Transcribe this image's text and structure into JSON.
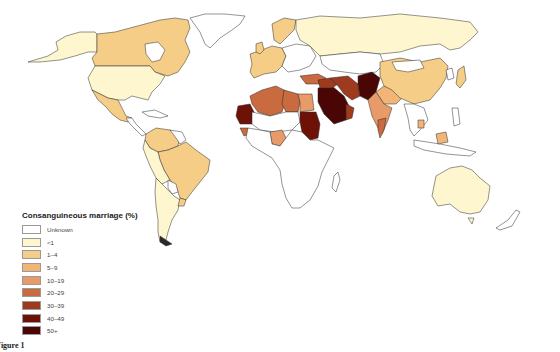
{
  "figure": {
    "caption": "Figure 1",
    "title": "Consanguineous marriage (%)"
  },
  "legend": {
    "title": "Consanguineous marriage (%)",
    "items": [
      {
        "label": "Unknown",
        "color": "#ffffff"
      },
      {
        "label": "<1",
        "color": "#fdf6cf"
      },
      {
        "label": "1–4",
        "color": "#f5cd86"
      },
      {
        "label": "5–9",
        "color": "#f2b577"
      },
      {
        "label": "10–19",
        "color": "#e99a69"
      },
      {
        "label": "20–29",
        "color": "#c96a3f"
      },
      {
        "label": "30–39",
        "color": "#9e3a1e"
      },
      {
        "label": "40–49",
        "color": "#6e1208"
      },
      {
        "label": "50+",
        "color": "#4a0505"
      }
    ]
  },
  "regions": [
    {
      "name": "Alaska",
      "category": "<1"
    },
    {
      "name": "Canada",
      "category": "1–4"
    },
    {
      "name": "Greenland",
      "category": "Unknown"
    },
    {
      "name": "United States",
      "category": "<1"
    },
    {
      "name": "Mexico",
      "category": "1–4"
    },
    {
      "name": "Central America",
      "category": "Unknown"
    },
    {
      "name": "Brazil",
      "category": "1–4"
    },
    {
      "name": "Venezuela/Colombia",
      "category": "1–4"
    },
    {
      "name": "Peru/Bolivia",
      "category": "<1"
    },
    {
      "name": "Argentina/Chile",
      "category": "<1"
    },
    {
      "name": "Western Europe",
      "category": "1–4"
    },
    {
      "name": "Eastern Europe",
      "category": "Unknown"
    },
    {
      "name": "Russia",
      "category": "<1"
    },
    {
      "name": "Morocco/Algeria",
      "category": "20–29"
    },
    {
      "name": "Libya",
      "category": "20–29"
    },
    {
      "name": "Egypt",
      "category": "10–19"
    },
    {
      "name": "Mauritania",
      "category": "40–49"
    },
    {
      "name": "Sudan",
      "category": "40–49"
    },
    {
      "name": "Saudi Arabia",
      "category": "50+"
    },
    {
      "name": "Iran/Iraq",
      "category": "30–39"
    },
    {
      "name": "Pakistan/Afghanistan",
      "category": "50+"
    },
    {
      "name": "India",
      "category": "10–19"
    },
    {
      "name": "South India",
      "category": "20–29"
    },
    {
      "name": "Nigeria",
      "category": "10–19"
    },
    {
      "name": "China",
      "category": "1–4"
    },
    {
      "name": "Japan",
      "category": "1–4"
    },
    {
      "name": "Southeast Asia",
      "category": "Unknown"
    },
    {
      "name": "Sub-Saharan Africa",
      "category": "Unknown"
    },
    {
      "name": "Australia",
      "category": "<1"
    },
    {
      "name": "New Zealand",
      "category": "Unknown"
    }
  ]
}
